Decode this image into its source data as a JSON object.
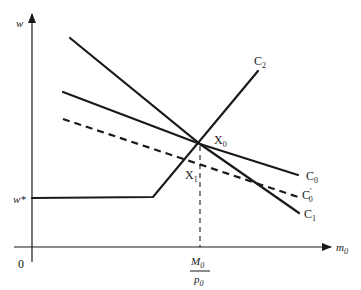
{
  "diagram": {
    "axes": {
      "y_label": "w",
      "x_label": "m",
      "x_label_sub": "0",
      "origin_label": "0",
      "y_mark_label": "w*",
      "x_mark_numerator": "M",
      "x_mark_numerator_sub": "0",
      "x_mark_denominator": "p",
      "x_mark_denominator_sub": "0"
    },
    "curves": [
      {
        "name": "C",
        "sub": "0",
        "prime": "",
        "style": "solid",
        "description": "downward sloping, shallower line through X0"
      },
      {
        "name": "C",
        "sub": "0",
        "prime": "′",
        "style": "dashed",
        "description": "dashed line parallel-ish below C0"
      },
      {
        "name": "C",
        "sub": "1",
        "prime": "",
        "style": "solid",
        "description": "steep downward line through X0"
      },
      {
        "name": "C",
        "sub": "2",
        "prime": "",
        "style": "solid",
        "description": "flat at w* then upward kinked line through X0"
      }
    ],
    "points": [
      {
        "name": "X",
        "sub": "0",
        "description": "intersection of C0, C1, C2"
      },
      {
        "name": "X",
        "sub": "1",
        "description": "intersection of C2 and C0′"
      }
    ],
    "color": "#1a1a1a"
  }
}
